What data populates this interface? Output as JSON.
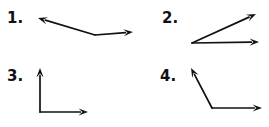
{
  "page": {
    "background_color": "#ffffff",
    "ink_color": "#111111",
    "width": 269,
    "height": 127
  },
  "figures": [
    {
      "number": "1.",
      "name": "obtuse-angle-shallow",
      "vertex": {
        "x": 95,
        "y": 35
      },
      "rays": [
        {
          "name": "ray-up-left",
          "tip": {
            "x": 38,
            "y": 18
          },
          "arrow": true
        },
        {
          "name": "ray-right",
          "tip": {
            "x": 133,
            "y": 32
          },
          "arrow": true
        }
      ]
    },
    {
      "number": "2.",
      "name": "acute-angle",
      "vertex": {
        "x": 192,
        "y": 43
      },
      "rays": [
        {
          "name": "ray-up-right",
          "tip": {
            "x": 256,
            "y": 14
          },
          "arrow": true
        },
        {
          "name": "ray-right",
          "tip": {
            "x": 259,
            "y": 42
          },
          "arrow": true
        }
      ]
    },
    {
      "number": "3.",
      "name": "right-angle",
      "vertex": {
        "x": 40,
        "y": 112
      },
      "rays": [
        {
          "name": "ray-up",
          "tip": {
            "x": 40,
            "y": 68
          },
          "arrow": true
        },
        {
          "name": "ray-right",
          "tip": {
            "x": 88,
            "y": 112
          },
          "arrow": true
        }
      ]
    },
    {
      "number": "4.",
      "name": "obtuse-angle",
      "vertex": {
        "x": 212,
        "y": 108
      },
      "rays": [
        {
          "name": "ray-up-left",
          "tip": {
            "x": 191,
            "y": 68
          },
          "arrow": true
        },
        {
          "name": "ray-right",
          "tip": {
            "x": 262,
            "y": 108
          },
          "arrow": true
        }
      ]
    }
  ],
  "labels": {
    "fig1": "1.",
    "fig2": "2.",
    "fig3": "3.",
    "fig4": "4."
  }
}
